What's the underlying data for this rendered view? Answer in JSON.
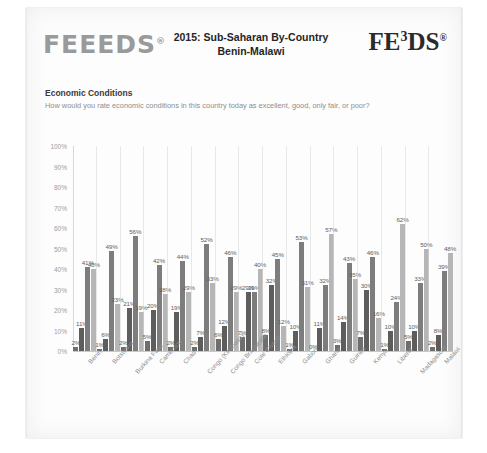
{
  "header": {
    "brand_left": "FEEEDS",
    "brand_left_mark": "®",
    "brand_right_pre": "FE",
    "brand_right_sup": "3",
    "brand_right_post": "DS",
    "brand_right_mark": "®",
    "title_line1": "2015: Sub-Saharan By-Country",
    "title_line2": "Benin-Malawi"
  },
  "section": {
    "title": "Economic Conditions",
    "question": "How would you rate economic conditions in this country today as excellent, good, only fair, or poor?"
  },
  "chart_data": {
    "type": "bar",
    "title": "Economic Conditions",
    "subtitle": "How would you rate economic conditions in this country today as excellent, good, only fair, or poor?",
    "xlabel": "",
    "ylabel": "",
    "ylim": [
      0,
      100
    ],
    "yticks": [
      "0%",
      "10%",
      "20%",
      "30%",
      "40%",
      "50%",
      "60%",
      "70%",
      "80%",
      "90%",
      "100%"
    ],
    "grid": false,
    "legend": "none",
    "value_suffix": "%",
    "colors": [
      "#6e6e6e",
      "#5d5d5d",
      "#7d7d7d",
      "#b6b6b6"
    ],
    "series": [
      {
        "name": "Excellent",
        "color": "#6e6e6e",
        "values": [
          2,
          1,
          2,
          5,
          2,
          2,
          6,
          7,
          8,
          1,
          0,
          3,
          7,
          1,
          5,
          2
        ]
      },
      {
        "name": "Good",
        "color": "#5d5d5d",
        "values": [
          11,
          6,
          21,
          20,
          19,
          7,
          12,
          29,
          32,
          10,
          11,
          14,
          30,
          10,
          10,
          8
        ]
      },
      {
        "name": "Only fair",
        "color": "#7d7d7d",
        "values": [
          41,
          49,
          56,
          42,
          44,
          52,
          46,
          29,
          45,
          53,
          32,
          43,
          46,
          24,
          33,
          39
        ]
      },
      {
        "name": "Poor",
        "color": "#b6b6b6",
        "values": [
          40,
          23,
          19,
          28,
          29,
          33,
          29,
          40,
          12,
          31,
          57,
          35,
          16,
          62,
          50,
          48
        ]
      }
    ],
    "categories": [
      "Benin",
      "Botswana",
      "Burkina Faso",
      "Cameroon",
      "Chad",
      "Congo (Kinshasa)",
      "Congo Brazzaville",
      "Cote d'Ivoire",
      "Ethiopia",
      "Gabon",
      "Ghana",
      "Guinea",
      "Kenya",
      "Liberia",
      "Madagascar",
      "Malawi"
    ],
    "category_label_offset": [
      0,
      0,
      1,
      0,
      0,
      1,
      1,
      0,
      0,
      0,
      0,
      0,
      0,
      0,
      1,
      0
    ]
  }
}
